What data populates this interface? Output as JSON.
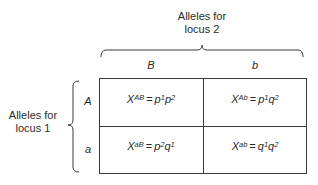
{
  "locus2_label": {
    "line1": "Alleles for",
    "line2": "locus 2"
  },
  "locus1_label": {
    "line1": "Alleles for",
    "line2": "locus 1"
  },
  "columns": [
    {
      "allele": "B"
    },
    {
      "allele": "b"
    }
  ],
  "rows": [
    {
      "allele": "A"
    },
    {
      "allele": "a"
    }
  ],
  "cells": [
    [
      {
        "var": "X",
        "var_sub": "AB",
        "eq": "=",
        "t1": "p",
        "t1_sub": "1",
        "t2": "p",
        "t2_sub": "2"
      },
      {
        "var": "X",
        "var_sub": "Ab",
        "eq": "=",
        "t1": "p",
        "t1_sub": "1",
        "t2": "q",
        "t2_sub": "2"
      }
    ],
    [
      {
        "var": "X",
        "var_sub": "aB",
        "eq": "=",
        "t1": "p",
        "t1_sub": "2",
        "t2": "q",
        "t2_sub": "1"
      },
      {
        "var": "X",
        "var_sub": "ab",
        "eq": "=",
        "t1": "q",
        "t1_sub": "1",
        "t2": "q",
        "t2_sub": "2"
      }
    ]
  ],
  "colors": {
    "line": "#3a3a3a",
    "text": "#2a2a2a",
    "background": "#ffffff"
  }
}
